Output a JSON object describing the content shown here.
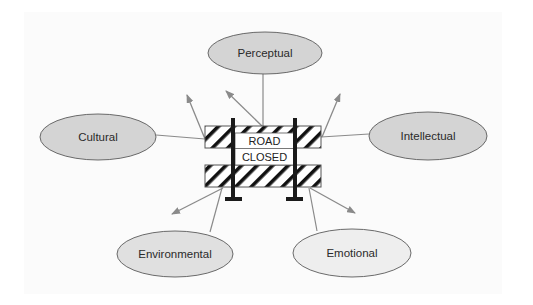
{
  "diagram": {
    "type": "barrier-concept-map",
    "center": {
      "label_line1": "ROAD",
      "label_line2": "CLOSED",
      "icon": "road-closed-barricade-icon"
    },
    "nodes": [
      {
        "id": "perceptual",
        "label": "Perceptual",
        "cx": 265,
        "cy": 53,
        "rx": 57,
        "ry": 21,
        "fill": "#d4d4d4"
      },
      {
        "id": "cultural",
        "label": "Cultural",
        "cx": 98,
        "cy": 137,
        "rx": 58,
        "ry": 23,
        "fill": "#d4d4d4"
      },
      {
        "id": "intellectual",
        "label": "Intellectual",
        "cx": 428,
        "cy": 136,
        "rx": 59,
        "ry": 24,
        "fill": "#d4d4d4"
      },
      {
        "id": "environmental",
        "label": "Environmental",
        "cx": 175,
        "cy": 254,
        "rx": 58,
        "ry": 23,
        "fill": "#e0e0e0"
      },
      {
        "id": "emotional",
        "label": "Emotional",
        "cx": 352,
        "cy": 253,
        "rx": 59,
        "ry": 24,
        "fill": "#eeeeee"
      }
    ],
    "colors": {
      "line": "#8a8a8a",
      "outline": "#5a5a5a",
      "post": "#1a1a1a",
      "stripe": "#111111",
      "background": "#ffffff"
    }
  }
}
